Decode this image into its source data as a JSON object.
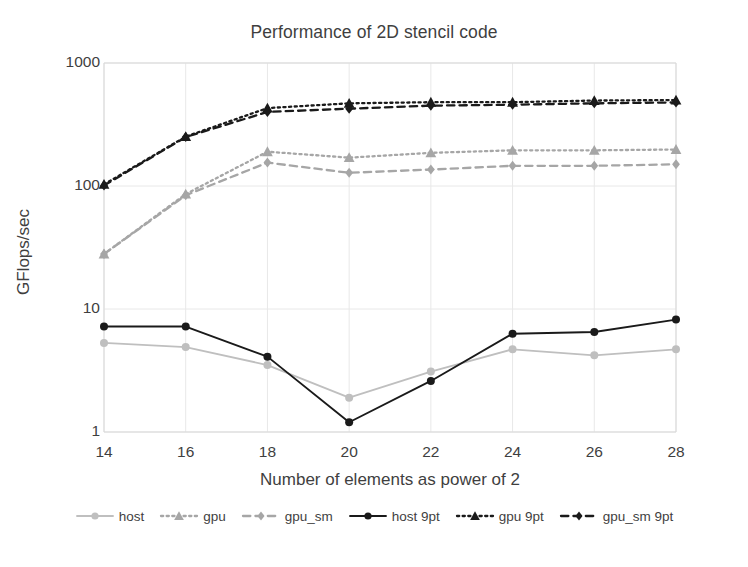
{
  "chart_data": {
    "type": "line",
    "title": "Performance of 2D stencil code",
    "xlabel": "Number of elements as power of 2",
    "ylabel": "GFlops/sec",
    "yscale": "log",
    "ylim": [
      1,
      1000
    ],
    "ytick_labels": [
      "1",
      "10",
      "100",
      "1000"
    ],
    "yticks": [
      1,
      10,
      100,
      1000
    ],
    "x": [
      14,
      16,
      18,
      20,
      22,
      24,
      26,
      28
    ],
    "xtick_labels": [
      "14",
      "16",
      "18",
      "20",
      "22",
      "24",
      "26",
      "28"
    ],
    "grid": true,
    "legend_position": "bottom",
    "series": [
      {
        "name": "host",
        "color": "#bfbfbf",
        "dash": "solid",
        "marker": "circle",
        "values": [
          5.3,
          4.9,
          3.5,
          1.9,
          3.1,
          4.7,
          4.2,
          4.7
        ]
      },
      {
        "name": "gpu",
        "color": "#a6a6a6",
        "dash": "dotted",
        "marker": "triangle",
        "values": [
          28,
          86,
          190,
          170,
          186,
          195,
          195,
          198
        ]
      },
      {
        "name": "gpu_sm",
        "color": "#a6a6a6",
        "dash": "dashed",
        "marker": "diamond",
        "values": [
          28,
          84,
          155,
          128,
          136,
          146,
          146,
          150
        ]
      },
      {
        "name": "host 9pt",
        "color": "#1a1a1a",
        "dash": "solid",
        "marker": "circle",
        "values": [
          7.2,
          7.2,
          4.1,
          1.2,
          2.6,
          6.3,
          6.5,
          8.2
        ]
      },
      {
        "name": "gpu 9pt",
        "color": "#1a1a1a",
        "dash": "dotted",
        "marker": "triangle",
        "values": [
          103,
          252,
          430,
          470,
          480,
          480,
          495,
          500
        ]
      },
      {
        "name": "gpu_sm 9pt",
        "color": "#1a1a1a",
        "dash": "dashed",
        "marker": "diamond",
        "values": [
          101,
          250,
          400,
          425,
          450,
          458,
          470,
          478
        ]
      }
    ]
  },
  "legend": {
    "items": [
      {
        "label": "host"
      },
      {
        "label": "gpu"
      },
      {
        "label": "gpu_sm"
      },
      {
        "label": "host 9pt"
      },
      {
        "label": "gpu 9pt"
      },
      {
        "label": "gpu_sm 9pt"
      }
    ]
  },
  "colors": {
    "axis": "#d9d9d9",
    "grid": "#e8e8e8",
    "text": "#3f3f3f",
    "light_gray": "#bfbfbf",
    "mid_gray": "#a6a6a6",
    "black": "#1a1a1a"
  }
}
